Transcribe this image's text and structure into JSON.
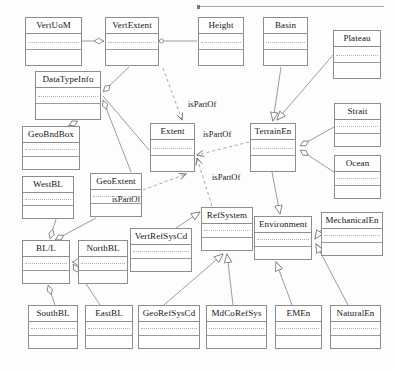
{
  "diagram": {
    "stroke_color": "#8d8d8d",
    "text_color": "#141414",
    "background": "#fdfdfd"
  },
  "top_rule": {
    "x": 198,
    "y": 6,
    "width": 186
  },
  "classes": [
    {
      "id": "VertUoM",
      "label": "VertUoM",
      "x": 25,
      "y": 17,
      "w": 57,
      "h": 49
    },
    {
      "id": "VertExtent",
      "label": "VertExtent",
      "x": 105,
      "y": 17,
      "w": 54,
      "h": 49
    },
    {
      "id": "Height",
      "label": "Height",
      "x": 198,
      "y": 17,
      "w": 46,
      "h": 49
    },
    {
      "id": "Basin",
      "label": "Basin",
      "x": 263,
      "y": 17,
      "w": 45,
      "h": 49
    },
    {
      "id": "Plateau",
      "label": "Plateau",
      "x": 333,
      "y": 30,
      "w": 48,
      "h": 49
    },
    {
      "id": "DataTypeInfo",
      "label": "DataTypeInfo",
      "x": 35,
      "y": 71,
      "w": 66,
      "h": 49
    },
    {
      "id": "Strait",
      "label": "Strait",
      "x": 334,
      "y": 103,
      "w": 47,
      "h": 44
    },
    {
      "id": "Extent",
      "label": "Extent",
      "x": 150,
      "y": 123,
      "w": 45,
      "h": 49
    },
    {
      "id": "TerrainEn",
      "label": "TerrainEn",
      "x": 250,
      "y": 123,
      "w": 46,
      "h": 49
    },
    {
      "id": "GeoBndBox",
      "label": "GeoBndBox",
      "x": 22,
      "y": 126,
      "w": 58,
      "h": 44
    },
    {
      "id": "Ocean",
      "label": "Ocean",
      "x": 334,
      "y": 155,
      "w": 47,
      "h": 44
    },
    {
      "id": "WestBL",
      "label": "WestBL",
      "x": 22,
      "y": 176,
      "w": 52,
      "h": 43
    },
    {
      "id": "GeoExtent",
      "label": "GeoExtent",
      "x": 90,
      "y": 173,
      "w": 52,
      "h": 44
    },
    {
      "id": "RefSystem",
      "label": "RefSystem",
      "x": 201,
      "y": 207,
      "w": 52,
      "h": 44
    },
    {
      "id": "Environment",
      "label": "Environment",
      "x": 254,
      "y": 216,
      "w": 58,
      "h": 44
    },
    {
      "id": "MechanicalEn",
      "label": "MechanicalEn",
      "x": 321,
      "y": 212,
      "w": 62,
      "h": 44
    },
    {
      "id": "VertRefSysCd",
      "label": "VertRefSysCd",
      "x": 130,
      "y": 228,
      "w": 62,
      "h": 44
    },
    {
      "id": "BL/L",
      "label": "BL/L",
      "x": 22,
      "y": 240,
      "w": 48,
      "h": 44
    },
    {
      "id": "NorthBL",
      "label": "NorthBL",
      "x": 78,
      "y": 240,
      "w": 50,
      "h": 44
    },
    {
      "id": "SouthBL",
      "label": "SouthBL",
      "x": 28,
      "y": 305,
      "w": 50,
      "h": 44
    },
    {
      "id": "EastBL",
      "label": "EastBL",
      "x": 85,
      "y": 305,
      "w": 48,
      "h": 44
    },
    {
      "id": "GeoRefSysCd",
      "label": "GeoRefSysCd",
      "x": 138,
      "y": 305,
      "w": 62,
      "h": 44
    },
    {
      "id": "MdCoRefSys",
      "label": "MdCoRefSys",
      "x": 206,
      "y": 305,
      "w": 61,
      "h": 44
    },
    {
      "id": "EMEn",
      "label": "EMEn",
      "x": 275,
      "y": 305,
      "w": 47,
      "h": 44
    },
    {
      "id": "NaturalEn",
      "label": "NaturalEn",
      "x": 330,
      "y": 305,
      "w": 51,
      "h": 44
    }
  ],
  "edge_labels": [
    {
      "id": "lbl-ispartof-vertextent-extent",
      "text": "isPartOf",
      "x": 188,
      "y": 99
    },
    {
      "id": "lbl-ispartof-terrainen-extent",
      "text": "isPartOf",
      "x": 203,
      "y": 129
    },
    {
      "id": "lbl-ispartof-refsystem-extent",
      "text": "isPartOf",
      "x": 212,
      "y": 172
    },
    {
      "id": "lbl-ispartof-geoextent-extent",
      "text": "isPartOf",
      "x": 112,
      "y": 194
    }
  ],
  "relationships": [
    {
      "type": "association",
      "from": "VertUoM",
      "to": "VertExtent"
    },
    {
      "type": "association",
      "from": "VertExtent",
      "to": "Height"
    },
    {
      "type": "aggregation",
      "from": "VertExtent",
      "to": "DataTypeInfo"
    },
    {
      "type": "aggregation",
      "from": "GeoExtent",
      "to": "DataTypeInfo"
    },
    {
      "type": "aggregation",
      "from": "GeoBndBox",
      "to": "DataTypeInfo"
    },
    {
      "type": "aggregation",
      "from": "WestBL",
      "to": "BL/L"
    },
    {
      "type": "aggregation",
      "from": "GeoExtent",
      "to": "BL/L"
    },
    {
      "type": "aggregation",
      "from": "NorthBL",
      "to": "BL/L"
    },
    {
      "type": "aggregation",
      "from": "SouthBL",
      "to": "BL/L"
    },
    {
      "type": "aggregation",
      "from": "EastBL",
      "to": "BL/L"
    },
    {
      "type": "dependency",
      "label": "isPartOf",
      "from": "VertExtent",
      "to": "Extent"
    },
    {
      "type": "dependency",
      "label": "isPartOf",
      "from": "TerrainEn",
      "to": "Extent"
    },
    {
      "type": "dependency",
      "label": "isPartOf",
      "from": "RefSystem",
      "to": "Extent"
    },
    {
      "type": "dependency",
      "label": "isPartOf",
      "from": "GeoExtent",
      "to": "Extent"
    },
    {
      "type": "generalization",
      "from": "Basin",
      "to": "TerrainEn"
    },
    {
      "type": "generalization",
      "from": "Plateau",
      "to": "TerrainEn"
    },
    {
      "type": "aggregation",
      "from": "Strait",
      "to": "TerrainEn"
    },
    {
      "type": "aggregation",
      "from": "Ocean",
      "to": "TerrainEn"
    },
    {
      "type": "generalization",
      "from": "TerrainEn",
      "to": "Environment"
    },
    {
      "type": "generalization",
      "from": "MechanicalEn",
      "to": "Environment"
    },
    {
      "type": "generalization",
      "from": "EMEn",
      "to": "Environment"
    },
    {
      "type": "generalization",
      "from": "NaturalEn",
      "to": "Environment"
    },
    {
      "type": "generalization",
      "from": "VertRefSysCd",
      "to": "RefSystem"
    },
    {
      "type": "generalization",
      "from": "GeoRefSysCd",
      "to": "RefSystem"
    },
    {
      "type": "generalization",
      "from": "MdCoRefSys",
      "to": "RefSystem"
    }
  ]
}
